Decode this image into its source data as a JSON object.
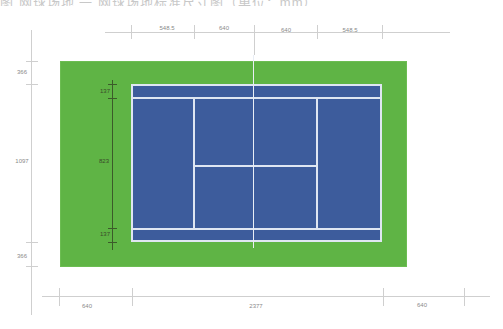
{
  "caption": "图 网球场地 一 网球场地标准尺寸图（单位：mm）",
  "colors": {
    "grass": "#5fb445",
    "court": "#3d5c9c",
    "lines": "#dfe6f2",
    "dimension_lines": "#cfcfcf"
  },
  "top_dimensions": [
    {
      "label": "548.5"
    },
    {
      "label": "640"
    },
    {
      "label": "640"
    },
    {
      "label": "548.5"
    }
  ],
  "left_dimensions": [
    {
      "label": "366"
    },
    {
      "label": "1097"
    },
    {
      "label": "366"
    }
  ],
  "inner_left_dimensions": [
    {
      "label": "137"
    },
    {
      "label": "823"
    },
    {
      "label": "137"
    }
  ],
  "bottom_dimensions": [
    {
      "label": "640"
    },
    {
      "label": "2377"
    },
    {
      "label": "640"
    }
  ]
}
